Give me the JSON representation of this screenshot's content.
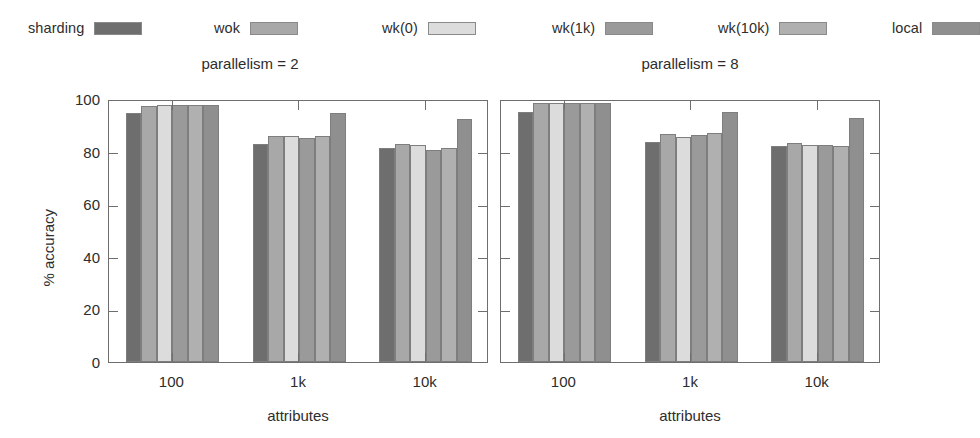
{
  "legend": {
    "items": [
      {
        "label": "sharding",
        "color": "#6e6e6e",
        "x": 28
      },
      {
        "label": "wok",
        "color": "#a8a8a8",
        "x": 214
      },
      {
        "label": "wk(0)",
        "color": "#dcdcdc",
        "x": 382
      },
      {
        "label": "wk(1k)",
        "color": "#9a9a9a",
        "x": 552
      },
      {
        "label": "wk(10k)",
        "color": "#b0b0b0",
        "x": 718
      },
      {
        "label": "local",
        "color": "#8f8f8f",
        "x": 892
      }
    ]
  },
  "chart_data": {
    "type": "bar",
    "title": "",
    "xlabel": "attributes",
    "ylabel": "% accuracy",
    "ylim": [
      0,
      100
    ],
    "yticks": [
      0,
      20,
      40,
      60,
      80,
      100
    ],
    "ytick_labels": [
      "0",
      "20",
      "40",
      "60",
      "80",
      "100"
    ],
    "categories": [
      "100",
      "1k",
      "10k"
    ],
    "grid": false,
    "legend_position": "top",
    "panels": [
      {
        "title": "parallelism = 2",
        "xlabel": "attributes",
        "ylabel": "% accuracy",
        "show_ytick_labels": true,
        "series": [
          {
            "name": "sharding",
            "color": "#6e6e6e",
            "values": [
              94.5,
              82.8,
              81.5
            ]
          },
          {
            "name": "wok",
            "color": "#a8a8a8",
            "values": [
              97.5,
              86.0,
              83.0
            ]
          },
          {
            "name": "wk(0)",
            "color": "#dcdcdc",
            "values": [
              97.8,
              86.0,
              82.5
            ]
          },
          {
            "name": "wk(1k)",
            "color": "#9a9a9a",
            "values": [
              97.6,
              85.2,
              80.5
            ]
          },
          {
            "name": "wk(10k)",
            "color": "#b0b0b0",
            "values": [
              97.6,
              86.0,
              81.5
            ]
          },
          {
            "name": "local",
            "color": "#8f8f8f",
            "values": [
              97.9,
              94.8,
              92.5
            ]
          }
        ]
      },
      {
        "title": "parallelism = 8",
        "xlabel": "attributes",
        "ylabel": "",
        "show_ytick_labels": false,
        "series": [
          {
            "name": "sharding",
            "color": "#6e6e6e",
            "values": [
              95.2,
              83.7,
              82.0
            ]
          },
          {
            "name": "wok",
            "color": "#a8a8a8",
            "values": [
              98.4,
              86.6,
              83.2
            ]
          },
          {
            "name": "wk(0)",
            "color": "#dcdcdc",
            "values": [
              98.5,
              85.6,
              82.5
            ]
          },
          {
            "name": "wk(1k)",
            "color": "#9a9a9a",
            "values": [
              98.4,
              86.4,
              82.5
            ]
          },
          {
            "name": "wk(10k)",
            "color": "#b0b0b0",
            "values": [
              98.4,
              87.0,
              82.3
            ]
          },
          {
            "name": "local",
            "color": "#8f8f8f",
            "values": [
              98.5,
              95.0,
              92.7
            ]
          }
        ]
      }
    ]
  }
}
